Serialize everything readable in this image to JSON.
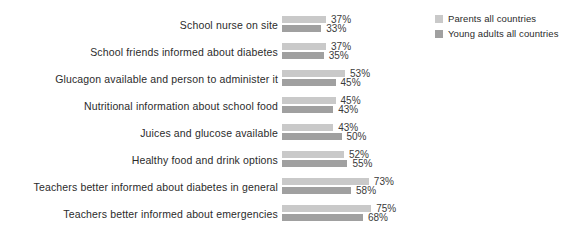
{
  "chart": {
    "type": "bar",
    "orientation": "horizontal",
    "title": "",
    "background": "#ffffff"
  },
  "legend": {
    "position": "top-right",
    "items": [
      {
        "label": "Parents all countries",
        "color": "#c9c9c9",
        "swatch": "legend-swatch-parents"
      },
      {
        "label": "Young adults all countries",
        "color": "#a0a0a0",
        "swatch": "legend-swatch-young-adults"
      }
    ]
  },
  "chart_data": {
    "type": "bar",
    "title": "",
    "xlabel": "",
    "ylabel": "",
    "xlim": [
      0,
      100
    ],
    "grid": false,
    "legend_position": "top-right",
    "value_suffix": "%",
    "categories": [
      "School nurse on site",
      "School friends informed about diabetes",
      "Glucagon available and person to administer it",
      "Nutritional information about school food",
      "Juices and glucose available",
      "Healthy food and drink options",
      "Teachers better informed about diabetes in general",
      "Teachers better informed about emergencies"
    ],
    "series": [
      {
        "name": "Parents all countries",
        "color": "#c9c9c9",
        "values": [
          37,
          37,
          53,
          45,
          43,
          52,
          73,
          75
        ],
        "labels": [
          "37%",
          "37%",
          "53%",
          "45%",
          "43%",
          "52%",
          "73%",
          "75%"
        ]
      },
      {
        "name": "Young adults all countries",
        "color": "#a0a0a0",
        "values": [
          33,
          35,
          45,
          43,
          50,
          55,
          58,
          68
        ],
        "labels": [
          "33%",
          "35%",
          "45%",
          "43%",
          "50%",
          "55%",
          "58%",
          "68%"
        ]
      }
    ]
  }
}
